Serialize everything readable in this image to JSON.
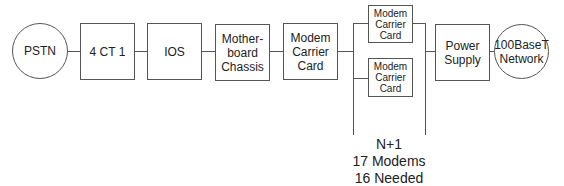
{
  "diagram": {
    "nodes": {
      "pstn": {
        "label": "PSTN",
        "shape": "circle"
      },
      "ct1": {
        "label": "4 CT 1",
        "shape": "box"
      },
      "ios": {
        "label": "IOS",
        "shape": "box"
      },
      "motherboard": {
        "label": "Mother-\nboard\nChassis",
        "shape": "box"
      },
      "modem_carrier_main": {
        "label": "Modem\nCarrier\nCard",
        "shape": "box"
      },
      "modem_carrier_top": {
        "label": "Modem\nCarrier\nCard",
        "shape": "box"
      },
      "modem_carrier_bottom": {
        "label": "Modem\nCarrier\nCard",
        "shape": "box"
      },
      "power_supply": {
        "label": "Power\nSupply",
        "shape": "box"
      },
      "network": {
        "label": "100BaseT\nNetwork",
        "shape": "circle"
      }
    },
    "redundancy_note": {
      "line1": "N+1",
      "line2": "17 Modems",
      "line3": "16 Needed"
    },
    "colors": {
      "stroke": "#555555",
      "text": "#222222",
      "background": "#ffffff"
    }
  }
}
